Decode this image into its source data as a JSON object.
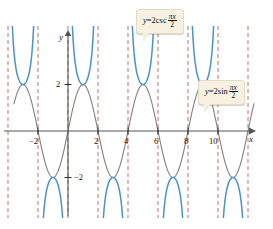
{
  "figure": {
    "background": "#ffffff",
    "width": 273,
    "height": 228
  },
  "axes": {
    "x_label": "x",
    "y_label": "y",
    "x_axis_color": "#555555",
    "y_axis_color": "#555555",
    "x_ticks": [
      {
        "value": -2,
        "label": "−2",
        "px": 38
      },
      {
        "value": 2,
        "label": "2",
        "px": 98
      },
      {
        "value": 4,
        "label": "4",
        "px": 128
      },
      {
        "value": 6,
        "label": "6",
        "px": 158
      },
      {
        "value": 8,
        "label": "8",
        "px": 188
      },
      {
        "value": 10,
        "label": "10",
        "px": 218
      }
    ],
    "y_ticks": [
      {
        "value": 2,
        "label": "2",
        "px": 79
      },
      {
        "value": -2,
        "label": "−2",
        "px": 172
      }
    ]
  },
  "callouts": [
    {
      "id": "csc",
      "name": "cosecant-equation-callout",
      "lhs": "y",
      "equals": "=",
      "coefficient": "2",
      "function": "csc",
      "numerator": "πx",
      "denominator": "2",
      "text": "y = 2csc πx/2",
      "background": "#f6f1e0",
      "border": "#e2dcc6"
    },
    {
      "id": "sin",
      "name": "sine-equation-callout",
      "lhs": "y",
      "equals": "=",
      "coefficient": "2",
      "function": "sin",
      "numerator": "πx",
      "denominator": "2",
      "text": "y = 2sin πx/2",
      "background": "#f6f1e0",
      "border": "#e2dcc6"
    }
  ],
  "chart_data": {
    "type": "line",
    "title": "",
    "xlabel": "x",
    "ylabel": "y",
    "xlim": [
      -3.2,
      12.2
    ],
    "ylim": [
      -4.3,
      4.3
    ],
    "grid": false,
    "legend": "callout-annotations",
    "series": [
      {
        "name": "y = 2sin(πx/2)",
        "equation": "y = 2 sin(pi*x/2)",
        "color": "#808080",
        "style": "solid",
        "width": 1.1,
        "amplitude": 2,
        "period": 4,
        "zeros": [
          -4,
          -2,
          0,
          2,
          4,
          6,
          8,
          10,
          12
        ],
        "maxima_x": [
          -3,
          1,
          5,
          9
        ],
        "maxima_y": 2,
        "minima_x": [
          -1,
          3,
          7,
          11
        ],
        "minima_y": -2
      },
      {
        "name": "y = 2csc(πx/2)",
        "equation": "y = 2 csc(pi*x/2)",
        "color": "#4a93c4",
        "style": "solid",
        "width": 1.5,
        "amplitude": 2,
        "period": 4,
        "asymptotes": [
          -4,
          -2,
          0,
          2,
          4,
          6,
          8,
          10,
          12
        ],
        "vertices_upper_x": [
          -3,
          1,
          5,
          9
        ],
        "vertices_upper_y": 2,
        "vertices_lower_x": [
          -1,
          3,
          7,
          11
        ],
        "vertices_lower_y": -2
      }
    ],
    "asymptote_lines": {
      "name": "vertical-asymptotes",
      "x_values": [
        -4,
        -2,
        0,
        2,
        4,
        6,
        8,
        10,
        12
      ],
      "color": "#b05a4a",
      "style": "dashed"
    }
  }
}
